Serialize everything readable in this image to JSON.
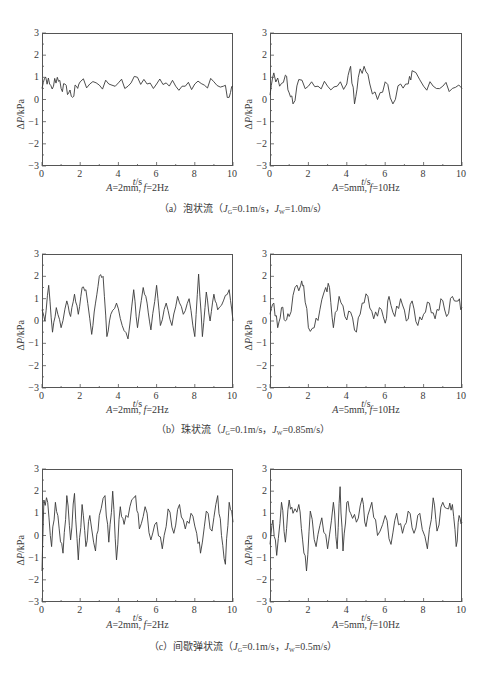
{
  "figure": {
    "rows": [
      {
        "id": "a",
        "caption": {
          "prefix": "（a）泡状流（",
          "jg_label": "J",
          "jg_sub": "G",
          "jg_value": "=0.1m/s，",
          "jw_label": "J",
          "jw_sub": "W",
          "jw_value": "=1.0m/s）"
        },
        "panels": [
          {
            "params_a": "A",
            "params_a_val": "=2mm, ",
            "params_f": "f",
            "params_f_val": "=2Hz"
          },
          {
            "params_a": "A",
            "params_a_val": "=5mm, ",
            "params_f": "f",
            "params_f_val": "=10Hz"
          }
        ]
      },
      {
        "id": "b",
        "caption": {
          "prefix": "（b）珠状流（",
          "jg_label": "J",
          "jg_sub": "G",
          "jg_value": "=0.1m/s，",
          "jw_label": "J",
          "jw_sub": "W",
          "jw_value": "=0.85m/s）"
        },
        "panels": [
          {
            "params_a": "A",
            "params_a_val": "=2mm, ",
            "params_f": "f",
            "params_f_val": "=2Hz"
          },
          {
            "params_a": "A",
            "params_a_val": "=5mm, ",
            "params_f": "f",
            "params_f_val": "=10Hz"
          }
        ]
      },
      {
        "id": "c",
        "caption": {
          "prefix": "（c）间歇弹状流（",
          "jg_label": "J",
          "jg_sub": "G",
          "jg_value": "=0.1m/s，",
          "jw_label": "J",
          "jw_sub": "W",
          "jw_value": "=0.5m/s）"
        },
        "panels": [
          {
            "params_a": "A",
            "params_a_val": "=2mm, ",
            "params_f": "f",
            "params_f_val": "=2Hz"
          },
          {
            "params_a": "A",
            "params_a_val": "=5mm, ",
            "params_f": "f",
            "params_f_val": "=10Hz"
          }
        ]
      }
    ],
    "axis": {
      "ylabel_delta": "Δ",
      "ylabel_p": "P",
      "ylabel_unit": "/kPa",
      "xlabel_t": "t",
      "xlabel_unit": "/s",
      "xticks": [
        "0",
        "2",
        "4",
        "6",
        "8",
        "10"
      ],
      "yticks": [
        "3",
        "2",
        "1",
        "0",
        "−1",
        "−2",
        "−3"
      ]
    },
    "line_color": "#3a3a3a",
    "frame_color": "#555555"
  },
  "chart_data": [
    {
      "type": "line",
      "title": "A=2mm, f=2Hz",
      "group": "(a) 泡状流 J_G=0.1m/s, J_W=1.0m/s",
      "xlabel": "t/s",
      "ylabel": "ΔP/kPa",
      "xlim": [
        0,
        10
      ],
      "ylim": [
        -3,
        3
      ],
      "grid": false,
      "x": [
        0,
        0.2,
        0.4,
        0.6,
        0.8,
        1.0,
        1.2,
        1.4,
        1.6,
        1.8,
        2.0,
        2.5,
        3.0,
        3.5,
        4.0,
        4.5,
        5.0,
        5.5,
        6.0,
        6.5,
        7.0,
        7.5,
        8.0,
        8.5,
        9.0,
        9.5,
        9.8,
        10.0
      ],
      "values": [
        0.5,
        1.0,
        0.7,
        0.6,
        1.0,
        0.5,
        0.7,
        0.3,
        0.1,
        0.6,
        0.8,
        0.7,
        0.65,
        0.7,
        0.75,
        0.6,
        1.0,
        0.7,
        0.7,
        0.75,
        0.6,
        0.6,
        0.7,
        0.65,
        0.8,
        0.6,
        0.1,
        0.6
      ]
    },
    {
      "type": "line",
      "title": "A=5mm, f=10Hz",
      "group": "(a) 泡状流 J_G=0.1m/s, J_W=1.0m/s",
      "xlabel": "t/s",
      "ylabel": "ΔP/kPa",
      "xlim": [
        0,
        10
      ],
      "ylim": [
        -3,
        3
      ],
      "grid": false,
      "x": [
        0,
        0.2,
        0.5,
        0.8,
        1.0,
        1.2,
        1.5,
        2.0,
        2.5,
        3.0,
        3.5,
        4.0,
        4.2,
        4.4,
        4.6,
        4.9,
        5.2,
        5.6,
        6.0,
        6.4,
        6.8,
        7.2,
        7.4,
        8.0,
        8.5,
        9.0,
        9.5,
        10.0
      ],
      "values": [
        0.2,
        1.2,
        0.6,
        1.1,
        0.3,
        -0.2,
        0.9,
        0.6,
        0.6,
        0.6,
        0.6,
        0.7,
        1.5,
        -0.2,
        1.0,
        1.5,
        0.7,
        0.0,
        0.8,
        -0.2,
        0.7,
        0.7,
        1.3,
        0.6,
        0.6,
        0.6,
        0.5,
        0.5
      ]
    },
    {
      "type": "line",
      "title": "A=2mm, f=2Hz",
      "group": "(b) 珠状流 J_G=0.1m/s, J_W=0.85m/s",
      "xlabel": "t/s",
      "ylabel": "ΔP/kPa",
      "xlim": [
        0,
        10
      ],
      "ylim": [
        -3,
        3
      ],
      "grid": false,
      "x": [
        0,
        0.15,
        0.35,
        0.55,
        0.75,
        1.0,
        1.3,
        1.5,
        1.7,
        1.9,
        2.1,
        2.3,
        2.6,
        2.8,
        3.0,
        3.2,
        3.4,
        3.6,
        3.9,
        4.2,
        4.5,
        4.8,
        5.0,
        5.3,
        5.5,
        5.7,
        6.0,
        6.2,
        6.5,
        6.8,
        7.1,
        7.4,
        7.7,
        8.0,
        8.2,
        8.4,
        8.6,
        8.8,
        9.0,
        9.2,
        9.5,
        9.8,
        10.0
      ],
      "values": [
        0.5,
        0.0,
        1.6,
        -0.5,
        0.6,
        -0.3,
        0.9,
        0.2,
        1.2,
        0.3,
        1.5,
        1.4,
        -0.6,
        0.8,
        2.0,
        2.0,
        -0.7,
        0.3,
        0.8,
        -0.2,
        -0.8,
        1.4,
        -0.3,
        1.5,
        0.8,
        -0.4,
        1.6,
        -0.2,
        0.8,
        -0.2,
        1.1,
        0.3,
        1.0,
        -0.7,
        2.1,
        -0.7,
        1.3,
        0.0,
        1.2,
        0.5,
        0.9,
        1.4,
        0.0
      ]
    },
    {
      "type": "line",
      "title": "A=5mm, f=10Hz",
      "group": "(b) 珠状流 J_G=0.1m/s, J_W=0.85m/s",
      "xlabel": "t/s",
      "ylabel": "ΔP/kPa",
      "xlim": [
        0,
        10
      ],
      "ylim": [
        -3,
        3
      ],
      "grid": false,
      "x": [
        0,
        0.2,
        0.4,
        0.6,
        0.8,
        1.0,
        1.3,
        1.6,
        1.75,
        2.0,
        2.3,
        2.6,
        2.9,
        3.1,
        3.3,
        3.6,
        3.9,
        4.2,
        4.5,
        4.8,
        5.1,
        5.4,
        5.7,
        6.0,
        6.2,
        6.5,
        6.8,
        7.1,
        7.4,
        7.7,
        8.0,
        8.3,
        8.6,
        8.9,
        9.2,
        9.5,
        9.8,
        10.0
      ],
      "values": [
        0.3,
        0.8,
        -0.3,
        0.6,
        0.0,
        0.2,
        1.5,
        1.6,
        1.6,
        -0.3,
        -0.3,
        0.5,
        1.5,
        1.5,
        -0.3,
        1.1,
        0.2,
        0.4,
        -0.5,
        0.8,
        1.1,
        0.1,
        0.6,
        -0.1,
        1.1,
        0.2,
        1.0,
        0.0,
        0.9,
        -0.2,
        0.3,
        0.8,
        0.1,
        1.0,
        0.2,
        1.1,
        0.9,
        0.6
      ]
    },
    {
      "type": "line",
      "title": "A=2mm, f=2Hz",
      "group": "(c) 间歇弹状流 J_G=0.1m/s, J_W=0.5m/s",
      "xlabel": "t/s",
      "ylabel": "ΔP/kPa",
      "xlim": [
        0,
        10
      ],
      "ylim": [
        -3,
        3
      ],
      "grid": false,
      "x": [
        0,
        0.1,
        0.3,
        0.5,
        0.7,
        0.9,
        1.1,
        1.3,
        1.5,
        1.7,
        1.9,
        2.1,
        2.3,
        2.5,
        2.8,
        3.0,
        3.3,
        3.5,
        3.7,
        3.9,
        4.1,
        4.3,
        4.6,
        4.9,
        5.1,
        5.4,
        5.7,
        6.0,
        6.3,
        6.6,
        6.9,
        7.2,
        7.5,
        7.8,
        8.1,
        8.3,
        8.6,
        8.9,
        9.2,
        9.4,
        9.6,
        9.8,
        10.0
      ],
      "values": [
        -1.6,
        1.6,
        1.5,
        -0.5,
        1.5,
        0.3,
        -0.8,
        1.8,
        -0.2,
        1.9,
        -1.1,
        1.4,
        -0.5,
        0.9,
        -0.7,
        0.9,
        1.8,
        -0.3,
        2.0,
        -1.1,
        1.3,
        0.5,
        1.3,
        1.8,
        0.3,
        1.3,
        -0.2,
        0.6,
        -0.6,
        1.2,
        0.1,
        1.4,
        0.3,
        1.0,
        0.1,
        -0.8,
        1.1,
        0.2,
        1.8,
        0.0,
        -1.3,
        1.5,
        0.6
      ]
    },
    {
      "type": "line",
      "title": "A=5mm, f=10Hz",
      "group": "(c) 间歇弹状流 J_G=0.1m/s, J_W=0.5m/s",
      "xlabel": "t/s",
      "ylabel": "ΔP/kPa",
      "xlim": [
        0,
        10
      ],
      "ylim": [
        -3,
        3
      ],
      "grid": false,
      "x": [
        0,
        0.15,
        0.35,
        0.6,
        0.8,
        1.0,
        1.2,
        1.5,
        1.7,
        1.9,
        2.1,
        2.4,
        2.7,
        3.0,
        3.3,
        3.5,
        3.65,
        3.8,
        4.0,
        4.2,
        4.5,
        4.8,
        5.0,
        5.3,
        5.6,
        6.0,
        6.3,
        6.6,
        6.9,
        7.2,
        7.5,
        7.8,
        8.2,
        8.5,
        8.7,
        9.0,
        9.3,
        9.5,
        9.7,
        9.85,
        10.0
      ],
      "values": [
        -0.4,
        0.7,
        -0.9,
        1.5,
        -0.3,
        1.6,
        1.0,
        1.4,
        -0.2,
        -1.6,
        1.1,
        -0.5,
        0.8,
        -0.6,
        1.5,
        -0.6,
        2.2,
        -0.7,
        1.5,
        1.0,
        0.6,
        1.7,
        0.4,
        1.5,
        0.0,
        0.9,
        -0.4,
        1.0,
        0.1,
        1.1,
        0.1,
        1.0,
        -0.6,
        1.7,
        0.2,
        1.5,
        1.2,
        1.4,
        -0.5,
        0.9,
        0.6
      ]
    }
  ]
}
